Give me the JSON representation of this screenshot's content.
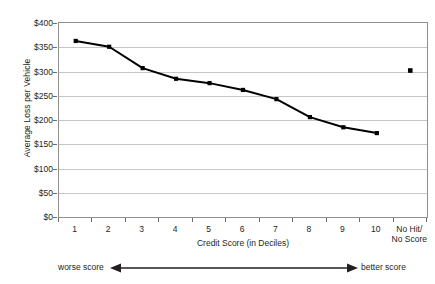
{
  "chart_data": {
    "type": "line",
    "title": "",
    "xlabel": "Credit Score (in Deciles)",
    "ylabel": "Average Loss per Vehicle",
    "categories": [
      "1",
      "2",
      "3",
      "4",
      "5",
      "6",
      "7",
      "8",
      "9",
      "10",
      "No Hit/\nNo Score"
    ],
    "series": [
      {
        "name": "Average Loss per Vehicle",
        "values": [
          363,
          351,
          307,
          285,
          276,
          262,
          243,
          206,
          185,
          173,
          null
        ]
      },
      {
        "name": "No Hit / No Score",
        "values": [
          null,
          null,
          null,
          null,
          null,
          null,
          null,
          null,
          null,
          null,
          302
        ]
      }
    ],
    "ylim": [
      0,
      400
    ],
    "ytick_values": [
      0,
      50,
      100,
      150,
      200,
      250,
      300,
      350,
      400
    ],
    "ytick_labels": [
      "$0",
      "$50",
      "$100",
      "$150",
      "$200",
      "$250",
      "$300",
      "$350",
      "$400"
    ],
    "grid": true,
    "legend": "none",
    "line_color": "#000000",
    "marker": "square",
    "marker_color": "#000000",
    "gridline_color": "#c6c6c6",
    "axis_color": "#8e8e8e"
  },
  "axes": {
    "y_title": "Average Loss per Vehicle",
    "x_title": "Credit Score (in Deciles)",
    "x_labels": [
      "1",
      "2",
      "3",
      "4",
      "5",
      "6",
      "7",
      "8",
      "9",
      "10"
    ],
    "x_label_last_line1": "No Hit/",
    "x_label_last_line2": "No Score",
    "y_labels": [
      "$400",
      "$350",
      "$300",
      "$250",
      "$200",
      "$150",
      "$100",
      "$50",
      "$0"
    ]
  },
  "annotation": {
    "worse_label": "worse score",
    "better_label": "better score",
    "arrow_icon": "double-headed-arrow-icon"
  }
}
